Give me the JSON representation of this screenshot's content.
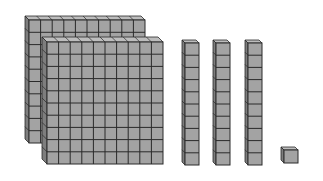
{
  "diagram": {
    "colors": {
      "face": "#a3a3a3",
      "side": "#7e7e7e",
      "top": "#bdbdbd",
      "grid": "#2a2a2a",
      "background": "#ffffff"
    },
    "blocks": [
      {
        "type": "flat",
        "label": "hundred",
        "units": 100,
        "grid": [
          10,
          10
        ]
      },
      {
        "type": "flat",
        "label": "hundred",
        "units": 100,
        "grid": [
          10,
          10
        ]
      },
      {
        "type": "rod",
        "label": "ten",
        "units": 10,
        "grid": [
          1,
          10
        ]
      },
      {
        "type": "rod",
        "label": "ten",
        "units": 10,
        "grid": [
          1,
          10
        ]
      },
      {
        "type": "rod",
        "label": "ten",
        "units": 10,
        "grid": [
          1,
          10
        ]
      },
      {
        "type": "unit",
        "label": "one",
        "units": 1,
        "grid": [
          1,
          1
        ]
      }
    ],
    "total_value": 231
  }
}
